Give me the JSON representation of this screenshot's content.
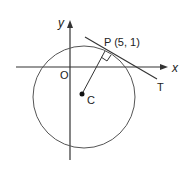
{
  "diagram": {
    "type": "circle-tangent",
    "axes": {
      "x_label": "x",
      "y_label": "y",
      "origin_label": "O"
    },
    "circle": {
      "center_label": "C"
    },
    "point": {
      "label": "P (5, 1)",
      "name": "P",
      "coordinates": [
        5,
        1
      ]
    },
    "tangent": {
      "label": "T"
    },
    "colors": {
      "stroke": "#333333",
      "circle": "#555555",
      "background": "#ffffff"
    }
  }
}
